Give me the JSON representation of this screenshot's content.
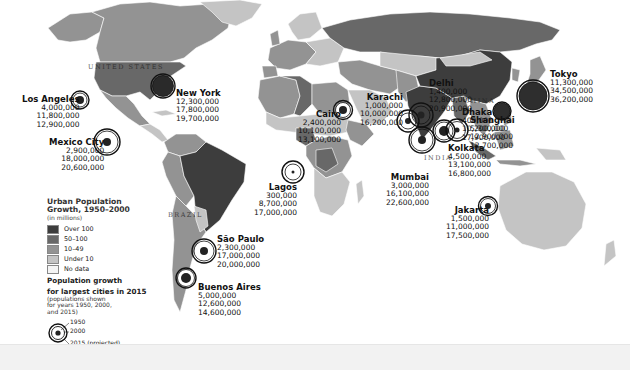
{
  "map": {
    "subject": "World Urban Population Growth",
    "colors": {
      "over_100": "#3d3d3d",
      "50_100": "#686868",
      "10_49": "#939393",
      "under_10": "#c4c4c4",
      "no_data": "#f4f4f4",
      "ocean": "#ffffff",
      "ring": "#111111"
    },
    "country_labels": [
      {
        "label": "UNITED STATES"
      },
      {
        "label": "BRAZIL"
      },
      {
        "label": "CHINA"
      },
      {
        "label": "INDIA"
      }
    ],
    "cities": [
      {
        "name": "Los Angeles",
        "p1950": "4,000,000",
        "p2000": "11,800,000",
        "p2015": "12,900,000"
      },
      {
        "name": "New York",
        "p1950": "12,300,000",
        "p2000": "17,800,000",
        "p2015": "19,700,000"
      },
      {
        "name": "Mexico City",
        "p1950": "2,900,000",
        "p2000": "18,000,000",
        "p2015": "20,600,000"
      },
      {
        "name": "São Paulo",
        "p1950": "2,300,000",
        "p2000": "17,000,000",
        "p2015": "20,000,000"
      },
      {
        "name": "Buenos Aires",
        "p1950": "5,000,000",
        "p2000": "12,600,000",
        "p2015": "14,600,000"
      },
      {
        "name": "Cairo",
        "p1950": "2,400,000",
        "p2000": "10,100,000",
        "p2015": "13,100,000"
      },
      {
        "name": "Lagos",
        "p1950": "300,000",
        "p2000": "8,700,000",
        "p2015": "17,000,000"
      },
      {
        "name": "Karachi",
        "p1950": "1,000,000",
        "p2000": "10,000,000",
        "p2015": "16,200,000"
      },
      {
        "name": "Delhi",
        "p1950": "1,400,000",
        "p2000": "12,800,000",
        "p2015": "20,900,000"
      },
      {
        "name": "Mumbai",
        "p1950": "3,000,000",
        "p2000": "16,100,000",
        "p2015": "22,600,000"
      },
      {
        "name": "Dhaka",
        "p1950": "400,000",
        "p2000": "10,200,000",
        "p2015": "17,900,000"
      },
      {
        "name": "Kolkata",
        "p1950": "4,500,000",
        "p2000": "13,100,000",
        "p2015": "16,800,000"
      },
      {
        "name": "Shanghai",
        "p1950": "5,300,000",
        "p2000": "12,900,000",
        "p2015": "12,700,000"
      },
      {
        "name": "Tokyo",
        "p1950": "11,300,000",
        "p2000": "34,500,000",
        "p2015": "36,200,000"
      },
      {
        "name": "Jakarta",
        "p1950": "1,500,000",
        "p2000": "11,000,000",
        "p2015": "17,500,000"
      }
    ]
  },
  "legend": {
    "title_line1": "Urban Population",
    "title_line2": "Growth, 1950–2000",
    "subtitle": "(in millions)",
    "items": [
      {
        "label": "Over 100",
        "color": "#3d3d3d"
      },
      {
        "label": "50–100",
        "color": "#686868"
      },
      {
        "label": "10–49",
        "color": "#939393"
      },
      {
        "label": "Under 10",
        "color": "#c4c4c4"
      },
      {
        "label": "No data",
        "color": "#f4f4f4"
      }
    ],
    "growth_title_line1": "Population growth",
    "growth_title_line2": "for largest cities in 2015",
    "growth_note_line1": "(populations shown",
    "growth_note_line2": "for years 1950, 2000,",
    "growth_note_line3": "and 2015)",
    "ring_1950": "1950",
    "ring_2000": "2000",
    "ring_2015": "2015 (projected)"
  }
}
